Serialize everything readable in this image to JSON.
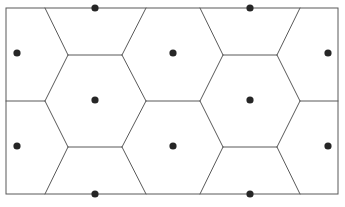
{
  "figure": {
    "name": "hexagonal-tiling-diagram",
    "type": "voronoi-hexagonal-lattice",
    "background_color": "#ffffff",
    "line_color": "#595959",
    "line_width": 1,
    "dot_color": "#262626",
    "dot_radius": 3.6,
    "canvas": {
      "width": 345,
      "height": 207
    },
    "frame": {
      "x": 6,
      "y": 8,
      "width": 332,
      "height": 186
    }
  },
  "chart_data": {
    "type": "scatter",
    "title": "",
    "xlabel": "",
    "ylabel": "",
    "xlim": [
      6,
      338
    ],
    "ylim": [
      8,
      194
    ],
    "grid": false,
    "legend": null,
    "site_points": [
      {
        "id": "p1",
        "x": 17,
        "y": 53,
        "position": "left-edge-upper"
      },
      {
        "id": "p2",
        "x": 17,
        "y": 146,
        "position": "left-edge-lower"
      },
      {
        "id": "p3",
        "x": 95,
        "y": 8,
        "position": "top-edge-left"
      },
      {
        "id": "p4",
        "x": 95,
        "y": 100,
        "position": "interior-left"
      },
      {
        "id": "p5",
        "x": 95,
        "y": 194,
        "position": "bottom-edge-left"
      },
      {
        "id": "p6",
        "x": 173,
        "y": 53,
        "position": "interior-upper-middle"
      },
      {
        "id": "p7",
        "x": 173,
        "y": 146,
        "position": "interior-lower-middle"
      },
      {
        "id": "p8",
        "x": 250,
        "y": 8,
        "position": "top-edge-right"
      },
      {
        "id": "p9",
        "x": 250,
        "y": 100,
        "position": "interior-right"
      },
      {
        "id": "p10",
        "x": 250,
        "y": 194,
        "position": "bottom-edge-right"
      },
      {
        "id": "p11",
        "x": 328,
        "y": 53,
        "position": "right-edge-upper"
      },
      {
        "id": "p12",
        "x": 328,
        "y": 146,
        "position": "right-edge-lower"
      }
    ],
    "cell_edges": [
      {
        "id": "e1",
        "x1": 45,
        "y1": 8,
        "x2": 68,
        "y2": 55,
        "kind": "diagonal"
      },
      {
        "id": "e2",
        "x1": 68,
        "y1": 55,
        "x2": 122,
        "y2": 55,
        "kind": "horizontal"
      },
      {
        "id": "e3",
        "x1": 122,
        "y1": 55,
        "x2": 146,
        "y2": 8,
        "kind": "diagonal"
      },
      {
        "id": "e4",
        "x1": 200,
        "y1": 8,
        "x2": 223,
        "y2": 55,
        "kind": "diagonal"
      },
      {
        "id": "e5",
        "x1": 223,
        "y1": 55,
        "x2": 277,
        "y2": 55,
        "kind": "horizontal"
      },
      {
        "id": "e6",
        "x1": 277,
        "y1": 55,
        "x2": 300,
        "y2": 8,
        "kind": "diagonal"
      },
      {
        "id": "e7",
        "x1": 6,
        "y1": 101,
        "x2": 45,
        "y2": 101,
        "kind": "horizontal"
      },
      {
        "id": "e8",
        "x1": 45,
        "y1": 101,
        "x2": 68,
        "y2": 55,
        "kind": "diagonal"
      },
      {
        "id": "e9",
        "x1": 122,
        "y1": 55,
        "x2": 146,
        "y2": 101,
        "kind": "diagonal"
      },
      {
        "id": "e10",
        "x1": 146,
        "y1": 101,
        "x2": 200,
        "y2": 101,
        "kind": "horizontal"
      },
      {
        "id": "e11",
        "x1": 200,
        "y1": 101,
        "x2": 223,
        "y2": 55,
        "kind": "diagonal"
      },
      {
        "id": "e12",
        "x1": 277,
        "y1": 55,
        "x2": 300,
        "y2": 101,
        "kind": "diagonal"
      },
      {
        "id": "e13",
        "x1": 300,
        "y1": 101,
        "x2": 338,
        "y2": 101,
        "kind": "horizontal"
      },
      {
        "id": "e14",
        "x1": 45,
        "y1": 101,
        "x2": 68,
        "y2": 147,
        "kind": "diagonal"
      },
      {
        "id": "e15",
        "x1": 68,
        "y1": 147,
        "x2": 122,
        "y2": 147,
        "kind": "horizontal"
      },
      {
        "id": "e16",
        "x1": 122,
        "y1": 147,
        "x2": 146,
        "y2": 101,
        "kind": "diagonal"
      },
      {
        "id": "e17",
        "x1": 200,
        "y1": 101,
        "x2": 223,
        "y2": 147,
        "kind": "diagonal"
      },
      {
        "id": "e18",
        "x1": 223,
        "y1": 147,
        "x2": 277,
        "y2": 147,
        "kind": "horizontal"
      },
      {
        "id": "e19",
        "x1": 277,
        "y1": 147,
        "x2": 300,
        "y2": 101,
        "kind": "diagonal"
      },
      {
        "id": "e20",
        "x1": 68,
        "y1": 147,
        "x2": 45,
        "y2": 194,
        "kind": "diagonal"
      },
      {
        "id": "e21",
        "x1": 122,
        "y1": 147,
        "x2": 146,
        "y2": 194,
        "kind": "diagonal"
      },
      {
        "id": "e22",
        "x1": 223,
        "y1": 147,
        "x2": 200,
        "y2": 194,
        "kind": "diagonal"
      },
      {
        "id": "e23",
        "x1": 277,
        "y1": 147,
        "x2": 300,
        "y2": 194,
        "kind": "diagonal"
      }
    ]
  }
}
